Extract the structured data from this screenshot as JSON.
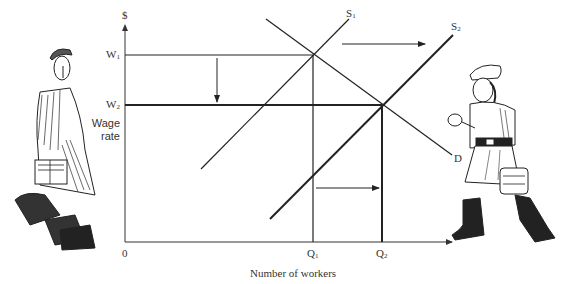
{
  "diagram": {
    "type": "labor-market supply shift",
    "y_axis": {
      "symbol": "$",
      "label_line1": "Wage",
      "label_line2": "rate"
    },
    "x_axis": {
      "origin": "0",
      "label": "Number of workers"
    },
    "wage_levels": [
      {
        "label": "W",
        "sub": "1"
      },
      {
        "label": "W",
        "sub": "2"
      }
    ],
    "quantity_levels": [
      {
        "label": "Q",
        "sub": "1"
      },
      {
        "label": "Q",
        "sub": "2"
      }
    ],
    "curves": [
      {
        "label": "S",
        "sub": "1",
        "kind": "supply"
      },
      {
        "label": "S",
        "sub": "2",
        "kind": "supply"
      },
      {
        "label": "D",
        "sub": "",
        "kind": "demand"
      }
    ],
    "arrows": [
      "supply shift right (S1 to S2)",
      "wage falls (W1 to W2)",
      "employment rises (Q1 to Q2)"
    ],
    "illustrations": [
      {
        "name": "worker-leaving",
        "description": "man with lunchbox walking away (left)"
      },
      {
        "name": "worker-arriving",
        "description": "woman in cap and boots with lunchbox striding in (right)"
      }
    ],
    "colors": {
      "ink": "#222222",
      "background": "#ffffff"
    }
  }
}
